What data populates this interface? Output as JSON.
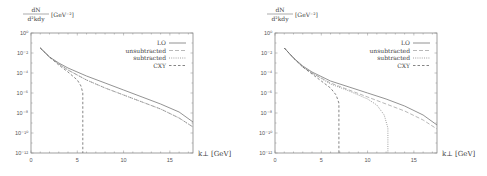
{
  "chart_data": [
    {
      "type": "line",
      "title": "",
      "xlabel": "k⊥ [GeV]",
      "ylabel": "dN/d²k dy [GeV⁻²]",
      "yscale": "log",
      "xlim": [
        0,
        17.5
      ],
      "ylim": [
        1e-12,
        1
      ],
      "xticks": [
        0,
        5,
        10,
        15
      ],
      "yticks": [
        "10^0",
        "10^-2",
        "10^-4",
        "10^-6",
        "10^-8",
        "10^-10",
        "10^-12"
      ],
      "grid": false,
      "legend_position": "upper right",
      "series": [
        {
          "name": "LO",
          "style": "solid",
          "x": [
            1,
            2,
            3,
            4,
            6,
            8,
            10,
            12,
            14,
            16,
            17.5
          ],
          "log10y": [
            -1.5,
            -2.4,
            -3.0,
            -3.5,
            -4.3,
            -5.0,
            -5.7,
            -6.4,
            -7.1,
            -7.9,
            -8.9
          ]
        },
        {
          "name": "unsubtracted",
          "style": "dashed-long",
          "x": [
            1,
            2,
            3,
            4,
            6,
            8,
            10,
            12,
            14,
            16,
            17.5
          ],
          "log10y": [
            -1.5,
            -2.4,
            -3.1,
            -3.7,
            -4.7,
            -5.5,
            -6.2,
            -6.9,
            -7.6,
            -8.5,
            -9.4
          ]
        },
        {
          "name": "subtracted",
          "style": "dotted",
          "x": [
            1,
            2,
            3,
            4,
            6,
            8,
            10,
            12,
            14,
            16,
            17.5
          ],
          "log10y": [
            -1.5,
            -2.4,
            -3.1,
            -3.7,
            -4.7,
            -5.5,
            -6.2,
            -6.9,
            -7.6,
            -8.5,
            -9.4
          ]
        },
        {
          "name": "CXY",
          "style": "dashed",
          "x": [
            1,
            2,
            3,
            4,
            5,
            5.4,
            5.6,
            5.6
          ],
          "log10y": [
            -1.5,
            -2.4,
            -3.2,
            -3.9,
            -4.7,
            -5.3,
            -6.0,
            -12
          ]
        }
      ]
    },
    {
      "type": "line",
      "title": "",
      "xlabel": "k⊥ [GeV]",
      "ylabel": "dN/d²k dy [GeV⁻²]",
      "yscale": "log",
      "xlim": [
        0,
        17.5
      ],
      "ylim": [
        1e-12,
        1
      ],
      "xticks": [
        0,
        5,
        10,
        15
      ],
      "yticks": [
        "10^0",
        "10^-2",
        "10^-4",
        "10^-6",
        "10^-8",
        "10^-10",
        "10^-12"
      ],
      "grid": false,
      "legend_position": "upper right",
      "series": [
        {
          "name": "LO",
          "style": "solid",
          "x": [
            1,
            2,
            3,
            4,
            6,
            8,
            10,
            12,
            14,
            16,
            17.5
          ],
          "log10y": [
            -1.5,
            -2.5,
            -3.3,
            -3.9,
            -4.8,
            -5.4,
            -6.0,
            -6.6,
            -7.3,
            -8.2,
            -9.2
          ]
        },
        {
          "name": "unsubtracted",
          "style": "dashed-long",
          "x": [
            1,
            2,
            3,
            4,
            6,
            8,
            10,
            12,
            14,
            16,
            17.5
          ],
          "log10y": [
            -1.5,
            -2.5,
            -3.4,
            -4.0,
            -5.0,
            -5.7,
            -6.4,
            -7.1,
            -7.8,
            -8.7,
            -9.6
          ]
        },
        {
          "name": "subtracted",
          "style": "dotted",
          "x": [
            1,
            2,
            3,
            4,
            6,
            8,
            10,
            11,
            11.8,
            12.2,
            12.2
          ],
          "log10y": [
            -1.5,
            -2.5,
            -3.4,
            -4.0,
            -5.1,
            -5.8,
            -6.6,
            -7.2,
            -8.2,
            -9.5,
            -12
          ]
        },
        {
          "name": "CXY",
          "style": "dashed",
          "x": [
            1,
            2,
            3,
            4,
            5,
            6,
            6.6,
            6.9,
            6.9
          ],
          "log10y": [
            -1.5,
            -2.5,
            -3.4,
            -4.1,
            -4.8,
            -5.5,
            -6.2,
            -7.0,
            -12
          ]
        }
      ]
    }
  ],
  "labels": {
    "ylabel_num": "dN",
    "ylabel_den": "d²kdy",
    "ylabel_unit": "[GeV⁻²]",
    "xlabel": "k⊥  [GeV]",
    "xticks": [
      "0",
      "5",
      "10",
      "15"
    ],
    "yticks": [
      "10⁰",
      "10⁻²",
      "10⁻⁴",
      "10⁻⁶",
      "10⁻⁸",
      "10⁻¹⁰",
      "10⁻¹²"
    ],
    "legend": [
      "LO",
      "unsubtracted",
      "subtracted",
      "CXY"
    ]
  }
}
